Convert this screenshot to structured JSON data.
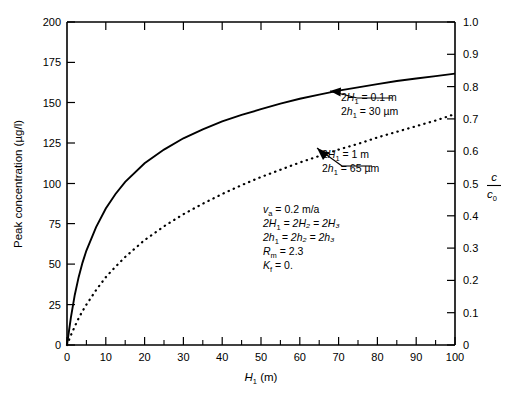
{
  "chart_data": {
    "type": "line",
    "title": "",
    "xlabel": "H1 (m)",
    "xlabel_base": "H",
    "xlabel_sub": "1",
    "xlabel_unit": " (m)",
    "ylabel": "Peak concentration (µg/l)",
    "ylabel_right_numerator": "c",
    "ylabel_right_denominator": "c",
    "ylabel_right_denominator_sub": "0",
    "xlim": [
      0,
      100
    ],
    "ylim": [
      0,
      200
    ],
    "ylim_right": [
      0,
      1.0
    ],
    "grid": false,
    "legend": "annotations",
    "xticks": [
      0,
      10,
      20,
      30,
      40,
      50,
      60,
      70,
      80,
      90,
      100
    ],
    "xtick_labels": [
      "0",
      "10",
      "20",
      "30",
      "40",
      "50",
      "60",
      "70",
      "80",
      "90",
      "100"
    ],
    "xminor_ticks": [
      5,
      15,
      25,
      35,
      45,
      55,
      65,
      75,
      85,
      95
    ],
    "yticks": [
      0,
      25,
      50,
      75,
      100,
      125,
      150,
      175,
      200
    ],
    "ytick_labels": [
      "0",
      "25",
      "50",
      "75",
      "100",
      "125",
      "150",
      "175",
      "200"
    ],
    "yticks_right": [
      0,
      0.1,
      0.2,
      0.3,
      0.4,
      0.5,
      0.6,
      0.7,
      0.8,
      0.9,
      1.0
    ],
    "ytick_labels_right": [
      "0",
      "0.1",
      "0.2",
      "0.3",
      "0.4",
      "0.5",
      "0.6",
      "0.7",
      "0.8",
      "0.9",
      "1.0"
    ],
    "x": [
      0,
      1,
      2,
      3,
      4,
      5,
      7.5,
      10,
      12.5,
      15,
      20,
      25,
      30,
      35,
      40,
      45,
      50,
      55,
      60,
      65,
      70,
      75,
      80,
      85,
      90,
      95,
      100
    ],
    "series": [
      {
        "name": "2H1 = 0.1 m, 2h1 = 30 um",
        "style": "solid",
        "values": [
          0,
          17,
          31,
          42,
          51,
          58.5,
          73,
          84.5,
          93.5,
          101,
          112.5,
          121,
          128,
          133.5,
          138.5,
          142.5,
          146,
          149.5,
          152.5,
          155,
          157.5,
          159.5,
          161.5,
          163.5,
          165,
          166.5,
          168
        ]
      },
      {
        "name": "2H1 = 1 m, 2h1 = 65 um",
        "style": "dotted",
        "values": [
          0,
          6,
          11.5,
          16.5,
          21,
          25,
          34,
          42,
          48.5,
          54.5,
          65,
          73.5,
          81,
          87.5,
          93.5,
          99,
          104,
          108.5,
          113,
          117,
          121,
          124.5,
          128.5,
          132,
          135.5,
          139,
          143
        ]
      }
    ],
    "annotations": [
      {
        "name": "curve-label-upper",
        "line1_prefix": "2",
        "line1_var": "H",
        "line1_sub": "1",
        "line1_value": " = 0.1 m",
        "line2_prefix": "2",
        "line2_var": "h",
        "line2_sub": "1",
        "line2_value": " = 30 µm",
        "points_to_x": 82,
        "points_to_y": 161.5
      },
      {
        "name": "curve-label-lower",
        "line1_prefix": "2",
        "line1_var": "H",
        "line1_sub": "1",
        "line1_value": " = 1 m",
        "line2_prefix": "2",
        "line2_var": "h",
        "line2_sub": "1",
        "line2_value": " = 65 µm",
        "points_to_x": 57,
        "points_to_y": 125
      }
    ],
    "parameter_box": [
      {
        "var": "v",
        "sub": "a",
        "rest": " = 0.2 m/a"
      },
      {
        "var": "2H",
        "sub": "1",
        "rest": " = 2H₂ = 2H₃"
      },
      {
        "var": "2h",
        "sub": "1",
        "rest": " = 2h₂ = 2h₃"
      },
      {
        "var": "R",
        "sub": "m",
        "rest": " = 2.3"
      },
      {
        "var": "K",
        "sub": "f",
        "rest": " = 0."
      }
    ],
    "colors": {
      "axis": "#000000",
      "curve": "#000000",
      "background": "#ffffff"
    }
  }
}
